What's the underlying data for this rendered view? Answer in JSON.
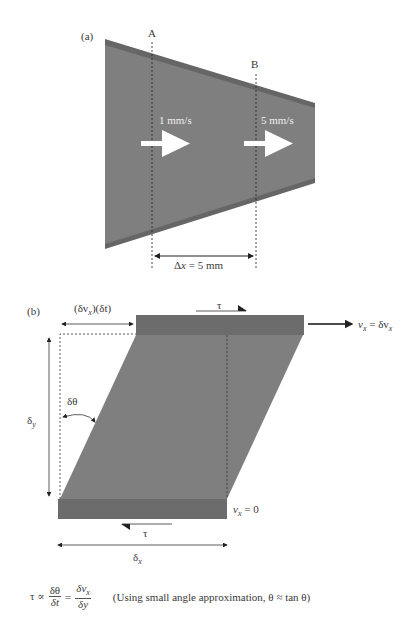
{
  "panel_a": {
    "label": "(a)",
    "section_a_label": "A",
    "section_b_label": "B",
    "velocity_a": "1 mm/s",
    "velocity_b": "5 mm/s",
    "distance_label_prefix": "Δ",
    "distance_label_var": "x",
    "distance_label_value": " = 5 mm"
  },
  "panel_b": {
    "label": "(b)",
    "displacement_label": "(δv",
    "displacement_sub": "x",
    "displacement_rest": ")(δt)",
    "tau_top": "τ",
    "tau_bottom": "τ",
    "top_velocity_var": "v",
    "top_velocity_sub": "x",
    "top_velocity_rest": " = δv",
    "top_velocity_sub2": "x",
    "bottom_velocity_var": "v",
    "bottom_velocity_sub": "x",
    "bottom_velocity_rest": " = 0",
    "angle_label": "δθ",
    "height_label": "δ",
    "height_sub": "y",
    "width_label": "δ",
    "width_sub": "x"
  },
  "equation": {
    "lhs": "τ ∝",
    "frac1_num": "δθ",
    "frac1_den": "δt",
    "equals": "=",
    "frac2_num": "δv",
    "frac2_num_sub": "x",
    "frac2_den": "δy",
    "note": "(Using small angle approximation, θ ≈ tan θ)"
  },
  "colors": {
    "fill": "#7f7f7f",
    "edge": "#666666",
    "plate": "#6f6f6f",
    "arrow_white": "#ffffff",
    "line": "#222222"
  }
}
